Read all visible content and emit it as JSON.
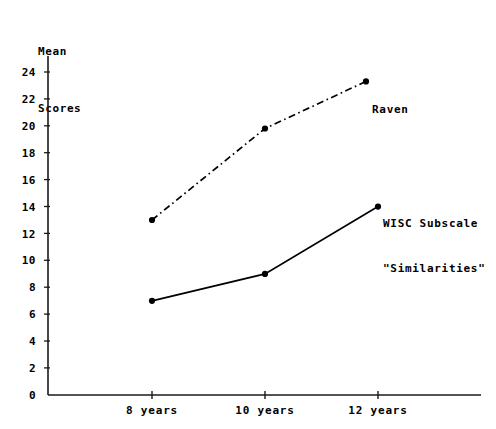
{
  "chart_data": {
    "type": "line",
    "title": "",
    "ylabel": "Mean\nScores",
    "ylabel_line1": "Mean",
    "ylabel_line2": "Scores",
    "xlabel": "",
    "categories": [
      "8 years",
      "10 years",
      "12 years"
    ],
    "yticks": [
      0,
      2,
      4,
      6,
      8,
      10,
      12,
      14,
      16,
      18,
      20,
      22,
      24
    ],
    "ytick_labels": [
      "0",
      "2",
      "4",
      "6",
      "8",
      "10",
      "12",
      "14",
      "16",
      "18",
      "20",
      "22",
      "24"
    ],
    "ylim": [
      0,
      25
    ],
    "grid": false,
    "legend_position": "inline-annotations",
    "series": [
      {
        "name": "Raven",
        "label": "Raven",
        "linestyle": "dash-dot",
        "color": "#000000",
        "marker": "dot",
        "values": [
          13,
          19.8,
          23.3
        ]
      },
      {
        "name": "WISC Subscale \"Similarities\"",
        "label_line1": "WISC Subscale",
        "label_line2": "\"Similarities\"",
        "linestyle": "solid",
        "color": "#000000",
        "marker": "dot",
        "values": [
          7,
          9,
          14
        ]
      }
    ]
  },
  "axis": {
    "y_axis_name": "mean-scores-axis",
    "x_axis_name": "age-axis"
  }
}
